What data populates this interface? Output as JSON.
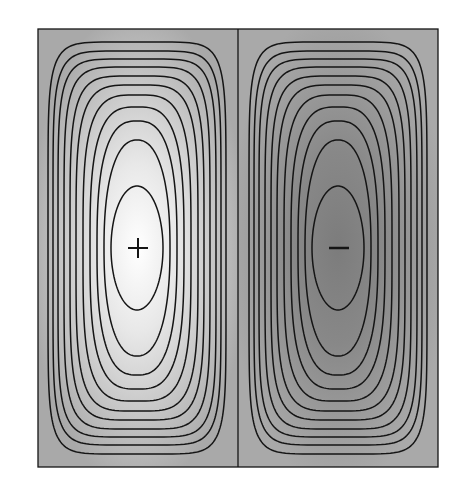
{
  "figure": {
    "type": "contour-plot",
    "box": {
      "x": 38,
      "y": 29,
      "width": 400,
      "height": 438
    },
    "divider_x": 238,
    "background_color": "#a9a9a9",
    "line_color": "#151515",
    "cells": [
      {
        "name": "left-cell",
        "sign": "+",
        "center": {
          "x": 137,
          "y": 248
        },
        "center_color": "#ffffff",
        "gradient": "light"
      },
      {
        "name": "right-cell",
        "sign": "−",
        "center": {
          "x": 338,
          "y": 248
        },
        "center_color": "#7e7e7e",
        "gradient": "dark"
      }
    ],
    "contour_count": 11
  }
}
